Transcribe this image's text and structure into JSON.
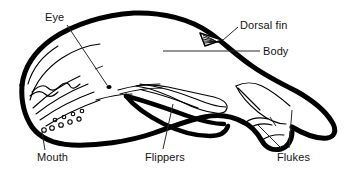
{
  "diagram": {
    "style": "black and white line drawing",
    "background_color": "#ffffff",
    "line_color": "#000000",
    "text_color": "#141414",
    "labels": [
      {
        "id": "eye",
        "text": "Eye",
        "x": 45,
        "y": 11,
        "leader": "diagonal line down-right to eye dot"
      },
      {
        "id": "dorsal",
        "text": "Dorsal fin",
        "x": 240,
        "y": 19,
        "leader": "short diagonal line down-left to hatched dorsal fin"
      },
      {
        "id": "body",
        "text": "Body",
        "x": 263,
        "y": 45,
        "leader": "long horizontal line left across the flank"
      },
      {
        "id": "mouth",
        "text": "Mouth",
        "x": 37,
        "y": 151,
        "leader": "short vertical line up to lower jaw line"
      },
      {
        "id": "flippers",
        "text": "Flippers",
        "x": 145,
        "y": 151,
        "leader": "diagonal line up-right to pectoral flipper"
      },
      {
        "id": "flukes",
        "text": "Flukes",
        "x": 277,
        "y": 151,
        "leader": "two lines forming a V up to the tail flukes"
      }
    ],
    "parts": [
      "eye",
      "dorsal fin",
      "body",
      "mouth",
      "flippers",
      "flukes"
    ]
  }
}
